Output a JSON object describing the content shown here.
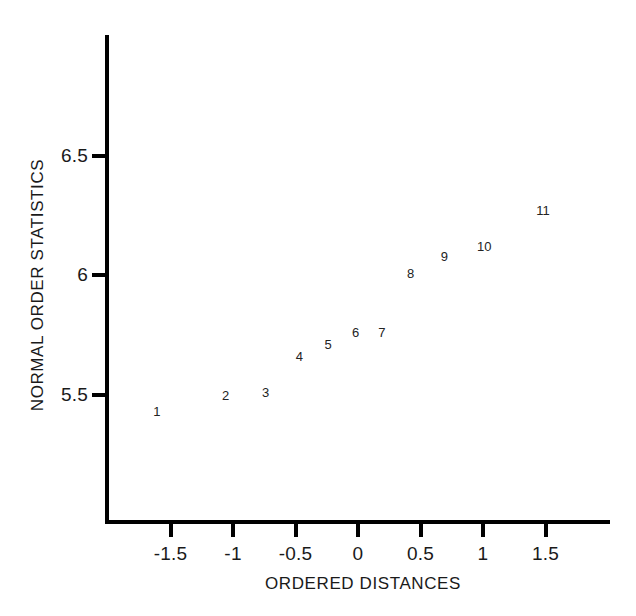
{
  "chart_data": {
    "type": "scatter",
    "title": "",
    "subtitle": "",
    "xlabel": "ORDERED DISTANCES",
    "ylabel": "NORMAL ORDER STATISTICS",
    "xlim": [
      -1.92,
      2.1
    ],
    "ylim": [
      5.27,
      6.85
    ],
    "xticks": [
      -1.5,
      -1,
      -0.5,
      0,
      0.5,
      1,
      1.5
    ],
    "xtick_labels": [
      "-1.5",
      "-1",
      "-0.5",
      "0",
      "0.5",
      "1",
      "1.5"
    ],
    "yticks": [
      5.5,
      6,
      6.5
    ],
    "ytick_labels": [
      "5.5",
      "6",
      "6.5"
    ],
    "grid": false,
    "legend": false,
    "marker_style": "numeric-label",
    "points": [
      {
        "label": "1",
        "x": -1.61,
        "y": 5.43
      },
      {
        "label": "2",
        "x": -1.06,
        "y": 5.5
      },
      {
        "label": "3",
        "x": -0.74,
        "y": 5.51
      },
      {
        "label": "4",
        "x": -0.47,
        "y": 5.66
      },
      {
        "label": "5",
        "x": -0.24,
        "y": 5.71
      },
      {
        "label": "6",
        "x": -0.02,
        "y": 5.76
      },
      {
        "label": "7",
        "x": 0.19,
        "y": 5.76
      },
      {
        "label": "8",
        "x": 0.42,
        "y": 6.01
      },
      {
        "label": "9",
        "x": 0.69,
        "y": 6.08
      },
      {
        "label": "10",
        "x": 1.01,
        "y": 6.12
      },
      {
        "label": "11",
        "x": 1.48,
        "y": 6.27
      }
    ]
  },
  "colors": {
    "axis": "#000000",
    "text": "#1a1a1a",
    "point_label": "#232323",
    "background": "#ffffff"
  }
}
